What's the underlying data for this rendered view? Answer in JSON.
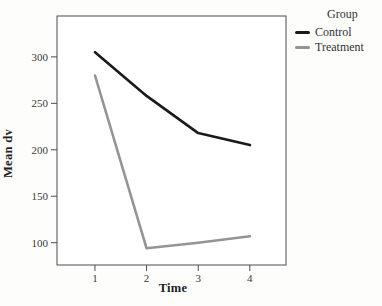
{
  "chart_data": {
    "type": "line",
    "x": [
      1,
      2,
      3,
      4
    ],
    "series": [
      {
        "name": "Control",
        "values": [
          305,
          258,
          218,
          205
        ],
        "color": "#1a1a1a"
      },
      {
        "name": "Treatment",
        "values": [
          280,
          94,
          100,
          107
        ],
        "color": "#949494"
      }
    ],
    "title": "",
    "xlabel": "Time",
    "ylabel": "Mean dv",
    "x_ticks": [
      1,
      2,
      3,
      4
    ],
    "y_ticks": [
      100,
      150,
      200,
      250,
      300
    ],
    "xlim": [
      0.265,
      4.7
    ],
    "ylim": [
      76,
      344
    ],
    "grid": false,
    "frame": "full-box",
    "legend_title": "Group",
    "legend_position": "top-right-outside"
  },
  "axes": {
    "x_label": "Time",
    "y_label": "Mean dv"
  },
  "legend": {
    "title": "Group",
    "items": [
      {
        "label": "Control",
        "color": "#1a1a1a"
      },
      {
        "label": "Treatment",
        "color": "#949494"
      }
    ]
  },
  "colors": {
    "background": "#fdfdfc",
    "plot_background": "#ffffff",
    "frame": "#4d4d4d",
    "tick": "#4d4d4d",
    "text": "#3a3a3a"
  }
}
